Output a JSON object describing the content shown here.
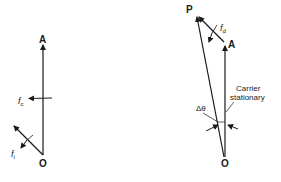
{
  "diagram": {
    "left": {
      "point_a": "A",
      "point_o": "O",
      "carrier_freq": "f",
      "carrier_sub": "c",
      "input_freq": "f",
      "input_sub": "i"
    },
    "right": {
      "point_p": "P",
      "point_a": "A",
      "point_o": "O",
      "deviation_freq": "f",
      "deviation_sub": "d",
      "carrier_label_line1": "Carrier",
      "carrier_label_line2": "stationary",
      "angle_label": "Δθ"
    },
    "colors": {
      "ink": "#1a1a1a",
      "background": "#ffffff"
    }
  }
}
